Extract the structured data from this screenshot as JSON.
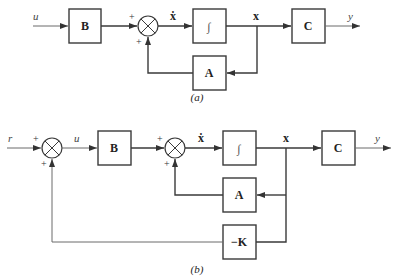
{
  "diagram_a": {
    "caption": "(a)",
    "input_label": "u",
    "output_label": "y",
    "state_label": "x",
    "state_dot_label": "ẋ",
    "blocks": {
      "B": "B",
      "integrator": "∫",
      "C": "C",
      "A": "A"
    },
    "summer_signs": {
      "top": "+",
      "bottom": "+"
    }
  },
  "diagram_b": {
    "caption": "(b)",
    "reference_label": "r",
    "control_label": "u",
    "output_label": "y",
    "state_label": "x",
    "state_dot_label": "ẋ",
    "blocks": {
      "B": "B",
      "integrator": "∫",
      "C": "C",
      "A": "A",
      "K": "−K"
    },
    "summer1_signs": {
      "top": "+",
      "bottom": "+"
    },
    "summer2_signs": {
      "top": "+",
      "bottom": "+"
    }
  }
}
